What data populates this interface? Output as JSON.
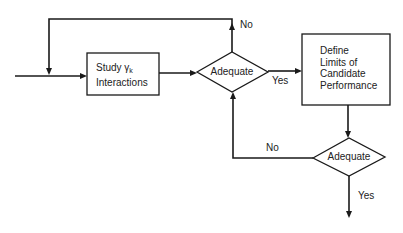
{
  "diagram": {
    "type": "flowchart",
    "nodes": {
      "study_box": {
        "shape": "rectangle",
        "line1": "Study γ",
        "subscript": "k",
        "line2": "Interactions"
      },
      "decision1": {
        "shape": "diamond",
        "label": "Adequate"
      },
      "define_box": {
        "shape": "rectangle",
        "lines": [
          "Define",
          "Limits of",
          "Candidate",
          "Performance"
        ]
      },
      "decision2": {
        "shape": "diamond",
        "label": "Adequate"
      }
    },
    "edge_labels": {
      "decision1_no": "No",
      "decision1_yes": "Yes",
      "decision2_no": "No",
      "decision2_yes": "Yes"
    },
    "edges": [
      {
        "from": "entry",
        "to": "study_box"
      },
      {
        "from": "study_box",
        "to": "decision1"
      },
      {
        "from": "decision1",
        "to": "study_box_input",
        "label": "No",
        "route": "up-left-down loop"
      },
      {
        "from": "decision1",
        "to": "define_box",
        "label": "Yes"
      },
      {
        "from": "define_box",
        "to": "decision2"
      },
      {
        "from": "decision2",
        "to": "decision1",
        "label": "No",
        "route": "left-up"
      },
      {
        "from": "decision2",
        "to": "exit",
        "label": "Yes"
      }
    ],
    "colors": {
      "stroke": "#1a1a1a",
      "background": "#ffffff",
      "text": "#222222"
    }
  }
}
